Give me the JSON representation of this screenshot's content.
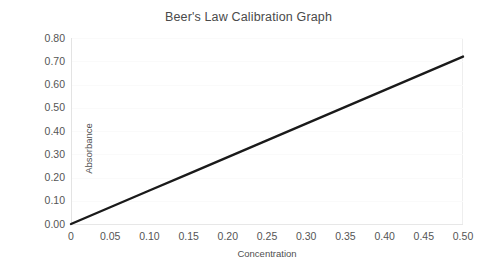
{
  "chart_data": {
    "type": "line",
    "title": "Beer's Law Calibration Graph",
    "xlabel": "Concentration",
    "ylabel": "Absorbance",
    "xlim": [
      0,
      0.5
    ],
    "ylim": [
      0.0,
      0.8
    ],
    "grid": true,
    "legend": null,
    "xticks": [
      "0",
      "0.05",
      "0.10",
      "0.15",
      "0.20",
      "0.25",
      "0.30",
      "0.35",
      "0.40",
      "0.45",
      "0.50"
    ],
    "xtick_values": [
      0,
      0.05,
      0.1,
      0.15,
      0.2,
      0.25,
      0.3,
      0.35,
      0.4,
      0.45,
      0.5
    ],
    "yticks": [
      "0.00",
      "0.10",
      "0.20",
      "0.30",
      "0.40",
      "0.50",
      "0.60",
      "0.70",
      "0.80"
    ],
    "ytick_values": [
      0.0,
      0.1,
      0.2,
      0.3,
      0.4,
      0.5,
      0.6,
      0.7,
      0.8
    ],
    "series": [
      {
        "name": "Calibration line",
        "color": "#1a1a1a",
        "width": 2.4,
        "x": [
          0,
          0.05,
          0.1,
          0.15,
          0.2,
          0.25,
          0.3,
          0.35,
          0.4,
          0.45,
          0.5
        ],
        "values": [
          0.0,
          0.072,
          0.144,
          0.216,
          0.288,
          0.36,
          0.432,
          0.504,
          0.576,
          0.648,
          0.72
        ]
      }
    ]
  },
  "style": {
    "background": "#ffffff",
    "text_color": "#4a4a4a",
    "tick_color": "#555555",
    "grid_color": "#fafafa",
    "axis_color": "#e5e5e5"
  }
}
